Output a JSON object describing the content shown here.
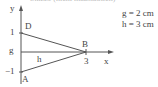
{
  "caption_cutoff": "Skizze (nicht maßstäblich)",
  "axes": {
    "x_label": "x",
    "y_label": "y"
  },
  "points": {
    "D": {
      "label": "D",
      "tick_label": "1"
    },
    "A": {
      "label": "A",
      "tick_label": "−1"
    },
    "B": {
      "label": "B",
      "tick_label": "3"
    }
  },
  "segments": {
    "g_label": "g",
    "h_label": "h"
  },
  "legend": {
    "g": "g = 2 cm",
    "h": "h = 3 cm"
  },
  "colors": {
    "line": "#555555",
    "text": "#444444",
    "background": "#ffffff"
  }
}
